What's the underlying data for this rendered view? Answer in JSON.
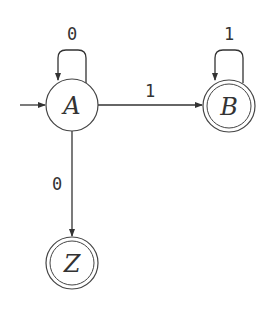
{
  "diagram": {
    "type": "finite-automaton",
    "start_state": "A",
    "states": [
      {
        "id": "A",
        "label": "A",
        "accepting": false,
        "cx": 72,
        "cy": 105
      },
      {
        "id": "B",
        "label": "B",
        "accepting": true,
        "cx": 229,
        "cy": 106
      },
      {
        "id": "Z",
        "label": "Z",
        "accepting": true,
        "cx": 72,
        "cy": 263
      }
    ],
    "transitions": [
      {
        "from": "A",
        "to": "A",
        "label": "0"
      },
      {
        "from": "A",
        "to": "B",
        "label": "1"
      },
      {
        "from": "B",
        "to": "B",
        "label": "1"
      },
      {
        "from": "A",
        "to": "Z",
        "label": "0"
      }
    ],
    "colors": {
      "stroke": "#333333",
      "background": "#ffffff"
    }
  }
}
